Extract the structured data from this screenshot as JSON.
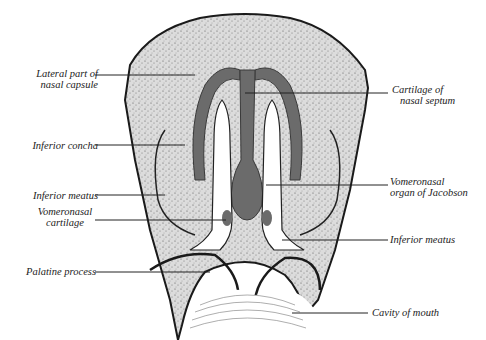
{
  "figure": {
    "colors": {
      "background": "#ffffff",
      "tissue": "#d9d9d9",
      "tissue_dark": "#bdbdbd",
      "cartilage": "#6b6b6b",
      "outline": "#1a1a1a",
      "cavity": "#ffffff",
      "leader": "#222222"
    }
  },
  "labels": {
    "lateral_part": {
      "line1": "Lateral part of",
      "line2": "nasal capsule"
    },
    "inferior_concha": "Inferior concha",
    "inferior_meatus_left": "Inferior meatus",
    "vomeronasal_cartilage": {
      "line1": "Vomeronasal",
      "line2": "cartilage"
    },
    "palatine_process": "Palatine process",
    "cartilage_septum": {
      "line1": "Cartilage of",
      "line2": "nasal septum"
    },
    "vomeronasal_organ": {
      "line1": "Vomeronasal",
      "line2": "organ of Jacobson"
    },
    "inferior_meatus_right": "Inferior meatus",
    "cavity_of_mouth": "Cavity of mouth"
  }
}
